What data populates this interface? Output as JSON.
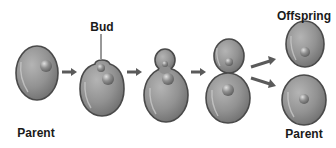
{
  "diagram": {
    "labels": {
      "bud": "Bud",
      "parent_start": "Parent",
      "offspring": "Offspring",
      "parent_end": "Parent"
    },
    "stages": [
      {
        "id": "stage-1",
        "description": "Parent cell with nucleus"
      },
      {
        "id": "stage-2",
        "description": "Bud forms on parent"
      },
      {
        "id": "stage-3",
        "description": "Bud enlarges, nucleus migrates"
      },
      {
        "id": "stage-4",
        "description": "Bud nearly separated"
      },
      {
        "id": "stage-5",
        "description": "Offspring and parent separate"
      }
    ],
    "colors": {
      "cell_fill": "#8c8c8c",
      "cell_edge": "#4a4a4a",
      "nucleus": "#7a7a7a",
      "arrow": "#5a5a5a",
      "text": "#1a1a1a"
    }
  }
}
